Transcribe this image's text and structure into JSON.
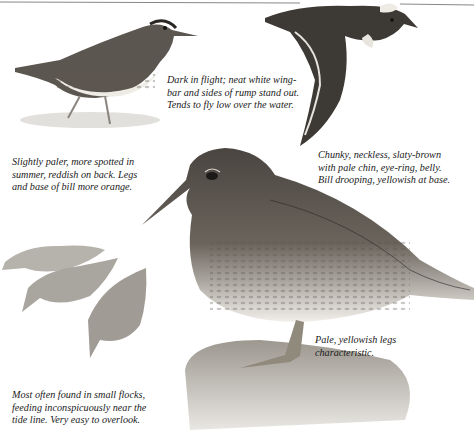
{
  "plate": {
    "subject": "sandpiper field guide plate",
    "captions": {
      "flight": [
        "Dark in flight; neat white wing-",
        "bar and sides of rump stand out.",
        "Tends to fly low over the water."
      ],
      "summer": [
        "Slightly paler, more spotted in",
        "summer, reddish on back. Legs",
        "and base of bill more orange."
      ],
      "main": [
        "Chunky, neckless, slaty-brown",
        "with pale chin, eye-ring, belly.",
        "Bill drooping, yellowish at base."
      ],
      "legs": [
        "Pale, yellowish legs",
        "characteristic."
      ],
      "flock": [
        "Most often found in small flocks,",
        "feeding inconspicuously near the",
        "tide line. Very easy to overlook."
      ]
    },
    "colors": {
      "background": "#ffffff",
      "text": "#1a1a1a",
      "bird_dark": "#3a3734",
      "bird_mid": "#7a746c",
      "bird_pale": "#e8e4dc",
      "rock": "#b8b4ae"
    }
  }
}
